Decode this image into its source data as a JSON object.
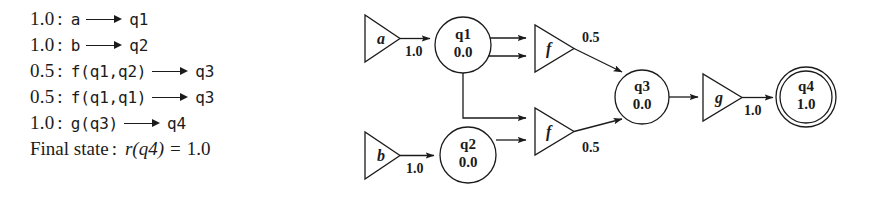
{
  "figure": {
    "kind": "weighted-tree-automaton",
    "ink_color": "#1b1b1b",
    "background_color": "#ffffff"
  },
  "rules": {
    "lines": [
      {
        "weight": "1.0",
        "colon": ":",
        "lhs": "a",
        "arrow": "⟶",
        "rhs": "q1"
      },
      {
        "weight": "1.0",
        "colon": ":",
        "lhs": "b",
        "arrow": "⟶",
        "rhs": "q2"
      },
      {
        "weight": "0.5",
        "colon": ":",
        "lhs": "f(q1,q2)",
        "arrow": "⟶",
        "rhs": "q3"
      },
      {
        "weight": "0.5",
        "colon": ":",
        "lhs": "f(q1,q1)",
        "arrow": "⟶",
        "rhs": "q3"
      },
      {
        "weight": "1.0",
        "colon": ":",
        "lhs": "g(q3)",
        "arrow": "⟶",
        "rhs": "q4"
      }
    ],
    "final": {
      "label": "Final state",
      "colon": ":",
      "func": "r",
      "open": "(",
      "arg": "q4",
      "close": ")",
      "equals": "=",
      "value": "1.0"
    }
  },
  "diagram": {
    "transitions": [
      {
        "id": "trans-a",
        "symbol": "a",
        "weight": "1.0"
      },
      {
        "id": "trans-b",
        "symbol": "b",
        "weight": "1.0"
      },
      {
        "id": "trans-f-top",
        "symbol": "f",
        "weight": "0.5"
      },
      {
        "id": "trans-f-bottom",
        "symbol": "f",
        "weight": "0.5"
      },
      {
        "id": "trans-g",
        "symbol": "g",
        "weight": "1.0"
      }
    ],
    "states": [
      {
        "id": "state-q1",
        "name": "q1",
        "value": "0.0",
        "final": false
      },
      {
        "id": "state-q2",
        "name": "q2",
        "value": "0.0",
        "final": false
      },
      {
        "id": "state-q3",
        "name": "q3",
        "value": "0.0",
        "final": false
      },
      {
        "id": "state-q4",
        "name": "q4",
        "value": "1.0",
        "final": true
      }
    ]
  }
}
